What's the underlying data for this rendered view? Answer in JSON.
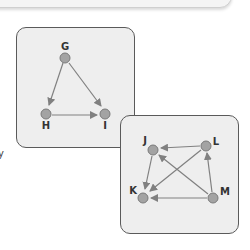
{
  "page": {
    "edge_text": "y"
  },
  "diagrams": [
    {
      "id": "graph-1",
      "nodes": [
        {
          "id": "G",
          "label": "G"
        },
        {
          "id": "H",
          "label": "H"
        },
        {
          "id": "I",
          "label": "I"
        }
      ],
      "edges": [
        {
          "from": "G",
          "to": "H"
        },
        {
          "from": "G",
          "to": "I"
        },
        {
          "from": "H",
          "to": "I"
        }
      ]
    },
    {
      "id": "graph-2",
      "nodes": [
        {
          "id": "J",
          "label": "J"
        },
        {
          "id": "K",
          "label": "K"
        },
        {
          "id": "L",
          "label": "L"
        },
        {
          "id": "M",
          "label": "M"
        }
      ],
      "edges": [
        {
          "from": "L",
          "to": "J"
        },
        {
          "from": "J",
          "to": "K"
        },
        {
          "from": "L",
          "to": "K"
        },
        {
          "from": "M",
          "to": "J"
        },
        {
          "from": "M",
          "to": "L"
        },
        {
          "from": "M",
          "to": "K"
        }
      ]
    }
  ],
  "colors": {
    "panel_bg": "#eeeeee",
    "panel_border": "#5a5a5a",
    "node_fill": "#a3a3a3",
    "node_stroke": "#7a7a7a",
    "edge": "#808080",
    "label": "#333333"
  }
}
